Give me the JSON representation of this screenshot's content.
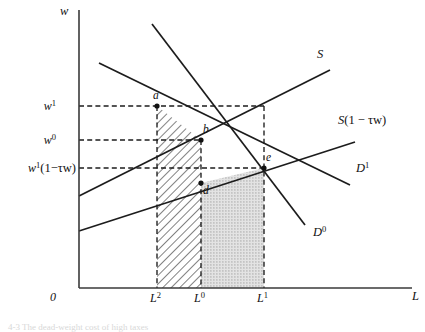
{
  "figure": {
    "kind": "labor-market-tax-wedge-diagram",
    "caption": "4-3  The dead-weight cost of high taxes"
  },
  "axes": {
    "y_label": "w",
    "x_label": "L",
    "origin_label": "0",
    "x_ticks": [
      {
        "id": "L2",
        "base": "L",
        "sup": "2",
        "x": 157
      },
      {
        "id": "L0",
        "base": "L",
        "sup": "0",
        "x": 201
      },
      {
        "id": "L1",
        "base": "L",
        "sup": "1",
        "x": 264
      }
    ],
    "y_ticks": [
      {
        "id": "w1",
        "base": "w",
        "sup": "1",
        "suffix": "",
        "y": 106
      },
      {
        "id": "w0",
        "base": "w",
        "sup": "0",
        "suffix": "",
        "y": 140
      },
      {
        "id": "w1net",
        "base": "w",
        "sup": "1",
        "suffix": "(1−τw)",
        "y": 168
      }
    ]
  },
  "curves": [
    {
      "id": "S",
      "label_base": "S",
      "label_sup": "",
      "label_suffix": ""
    },
    {
      "id": "Snet",
      "label_base": "S",
      "label_sup": "",
      "label_suffix": "(1 − τw)"
    },
    {
      "id": "D1",
      "label_base": "D",
      "label_sup": "1",
      "label_suffix": ""
    },
    {
      "id": "D0",
      "label_base": "D",
      "label_sup": "0",
      "label_suffix": ""
    }
  ],
  "points": [
    {
      "id": "a",
      "label": "a",
      "x": 157,
      "y": 106
    },
    {
      "id": "b",
      "label": "b",
      "x": 201,
      "y": 140
    },
    {
      "id": "d",
      "label": "d",
      "x": 201,
      "y": 183
    },
    {
      "id": "e",
      "label": "e",
      "x": 264,
      "y": 168
    }
  ],
  "regions": [
    {
      "id": "hatched",
      "pattern": "diagonal-hatch",
      "meaning": "dead-weight-loss-area"
    },
    {
      "id": "stippled",
      "pattern": "dot-stipple",
      "meaning": "tax-revenue-area"
    }
  ],
  "colors": {
    "stroke": "#1c1c1c",
    "axis": "#3a3a3a",
    "hatch": "#555555",
    "stipple": "#c9c9c9",
    "background": "#ffffff"
  }
}
